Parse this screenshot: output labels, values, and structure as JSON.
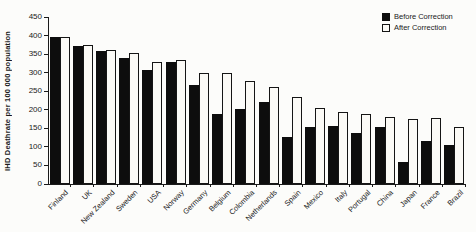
{
  "figure": {
    "background_color": "#fcfcfa",
    "bar_black_color": "#0d0d0d",
    "bar_white_color": "#fbfaf6",
    "axis_color": "#1a1a1a"
  },
  "chart_data": {
    "type": "bar",
    "title": "",
    "xlabel": "",
    "ylabel": "IHD Deathrate per 100 000 population",
    "ylim": [
      0,
      450
    ],
    "y_ticks": [
      0,
      50,
      100,
      150,
      200,
      250,
      300,
      350,
      400,
      450
    ],
    "grid": false,
    "legend_position": "top-right",
    "categories": [
      "Finland",
      "UK",
      "New Zealand",
      "Sweden",
      "USA",
      "Norway",
      "Germany",
      "Belgium",
      "Colombia",
      "Netherlands",
      "Spain",
      "Mexico",
      "Italy",
      "Portugal",
      "China",
      "Japan",
      "France",
      "Brazil"
    ],
    "series": [
      {
        "name": "Before Correction",
        "color": "#0d0d0d",
        "values": [
          395,
          373,
          359,
          340,
          308,
          328,
          268,
          188,
          203,
          222,
          128,
          154,
          156,
          137,
          154,
          60,
          115,
          105
        ]
      },
      {
        "name": "After Correction",
        "color": "#fbfaf6",
        "border_color": "#151515",
        "values": [
          397,
          375,
          361,
          353,
          330,
          333,
          300,
          298,
          278,
          262,
          234,
          204,
          194,
          188,
          181,
          176,
          177,
          154
        ]
      }
    ]
  }
}
